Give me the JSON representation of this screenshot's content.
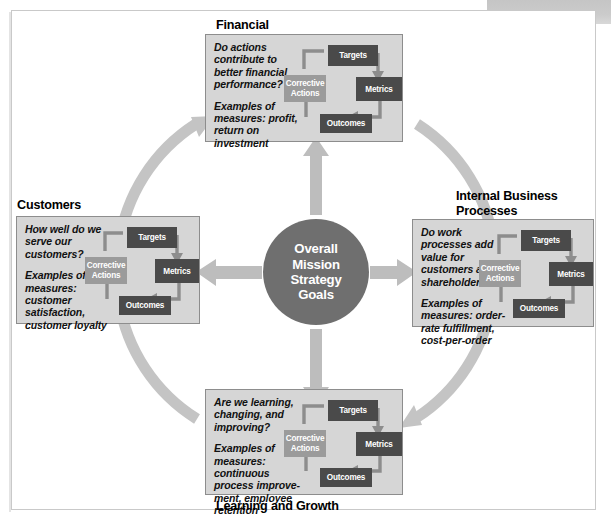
{
  "diagram": {
    "center": {
      "lines": [
        "Overall",
        "Mission",
        "Strategy",
        "Goals"
      ],
      "text": "Overall Mission Strategy Goals",
      "color": "#6f6f6f"
    },
    "cycle_box_labels": {
      "targets": "Targets",
      "metrics": "Metrics",
      "outcomes": "Outcomes",
      "corrective_line1": "Corrective",
      "corrective_line2": "Actions"
    },
    "colors": {
      "panel_fill": "#d6d6d6",
      "panel_border": "#8d8d8d",
      "box_dark": "#4a4a4a",
      "box_mid": "#9b9b9b",
      "arrow_light": "#bdbdbd",
      "arc": "#c4c4c4",
      "center_circle": "#6f6f6f",
      "frame_border": "#c9c9c9",
      "text": "#111111"
    },
    "quadrants": [
      {
        "id": "financial",
        "title": "Financial",
        "question": "Do actions contribute to better financial performance?",
        "examples": "Examples of measures: profit, return on investment"
      },
      {
        "id": "customers",
        "title": "Customers",
        "question": "How well do we serve our customers?",
        "examples": "Examples of measures: customer satisfaction, customer loyalty"
      },
      {
        "id": "internal-business-processes",
        "title": "Internal Business Processes",
        "question": "Do work processes add value for customers and shareholders?",
        "examples": "Examples of measures: order-rate fulfillment, cost-per-order"
      },
      {
        "id": "learning-and-growth",
        "title": "Learning and Growth",
        "question": "Are we learning, changing, and improving?",
        "examples": "Examples of measures: continuous process improve-ment, employee retention"
      }
    ]
  }
}
